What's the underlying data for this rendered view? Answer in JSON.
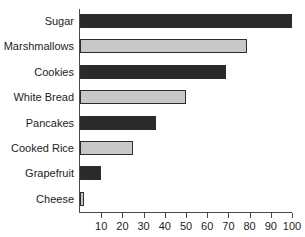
{
  "chart_data": {
    "type": "bar",
    "orientation": "horizontal",
    "title": "",
    "xlabel": "",
    "ylabel": "",
    "xlim": [
      0,
      105
    ],
    "grid": false,
    "legend": "none",
    "categories": [
      "Sugar",
      "Marshmallows",
      "Cookies",
      "White Bread",
      "Pancakes",
      "Cooked Rice",
      "Grapefruit",
      "Cheese"
    ],
    "values": [
      100,
      79,
      69,
      50,
      36,
      25,
      10,
      2
    ],
    "bar_colors": [
      "#2a2a2a",
      "#c8c8c8",
      "#2a2a2a",
      "#c8c8c8",
      "#2a2a2a",
      "#c8c8c8",
      "#2a2a2a",
      "#c8c8c8"
    ],
    "bar_styles": [
      "dark",
      "light",
      "dark",
      "light",
      "dark",
      "light",
      "dark",
      "light"
    ],
    "xticks": [
      10,
      20,
      30,
      40,
      50,
      60,
      70,
      80,
      90,
      100
    ],
    "xtick_labels": [
      "10",
      "20",
      "30",
      "40",
      "50",
      "60",
      "70",
      "80",
      "90",
      "100"
    ]
  },
  "axis": {
    "line_color": "#4a4a4a"
  },
  "colors": {
    "dark_bar": "#2a2a2a",
    "light_bar": "#c8c8c8",
    "bar_outline": "#2d2d2d",
    "text": "#1d1d1d",
    "background": "#ffffff"
  }
}
